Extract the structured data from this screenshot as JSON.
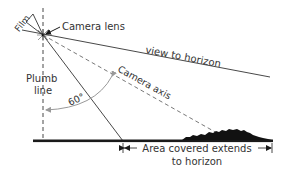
{
  "diagram": {
    "labels": {
      "film": "Film",
      "camera_lens": "Camera lens",
      "view_to_horizon": "view to horizon",
      "camera_axis": "Camera axis",
      "plumb_line_1": "Plumb",
      "plumb_line_2": "line",
      "angle": "60°",
      "area_covered_1": "Area covered extends",
      "area_covered_2": "to horizon"
    },
    "colors": {
      "line": "#333333",
      "ground": "#1a1a1a",
      "arc": "#999999",
      "background": "#ffffff"
    }
  }
}
